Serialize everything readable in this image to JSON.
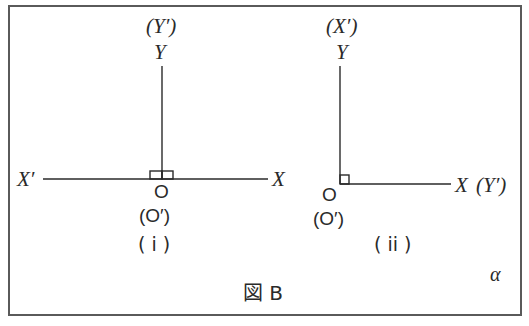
{
  "figure": {
    "caption": "図 B",
    "corner_mark": "α",
    "border_color": "#5a5a5a",
    "line_color": "#2a2a2a"
  },
  "diagram_i": {
    "label": "( i )",
    "y_top_alt": "(Y′)",
    "y_top": "Y",
    "x_left": "X′",
    "x_right": "X",
    "origin": "O",
    "origin_alt": "(O′)",
    "right_angle_marks": 2
  },
  "diagram_ii": {
    "label": "( ii )",
    "y_top_alt": "(X′)",
    "y_top": "Y",
    "x_right": "X",
    "x_right_alt": "(Y′)",
    "origin": "O",
    "origin_alt": "(O′)",
    "right_angle_marks": 1
  }
}
